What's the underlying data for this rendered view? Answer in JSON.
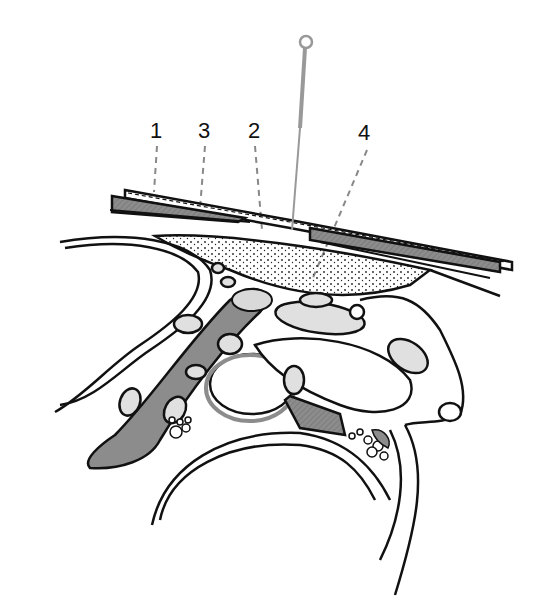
{
  "figure": {
    "type": "anatomical-illustration",
    "colors": {
      "outline": "#111111",
      "fill_gray": "#8c8c8c",
      "fill_light": "#bdbdbd",
      "needle": "#999999",
      "leader": "#888888",
      "background": "#ffffff"
    }
  },
  "labels": [
    {
      "id": "1",
      "text": "1",
      "x": 150,
      "y": 120
    },
    {
      "id": "3",
      "text": "3",
      "x": 198,
      "y": 120
    },
    {
      "id": "2",
      "text": "2",
      "x": 248,
      "y": 120
    },
    {
      "id": "4",
      "text": "4",
      "x": 358,
      "y": 122
    }
  ],
  "caption": {
    "text": ""
  }
}
